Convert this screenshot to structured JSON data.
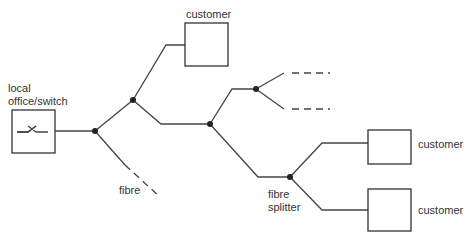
{
  "diagram": {
    "labels": {
      "local_office": "local",
      "local_office_line2": "office/switch",
      "fibre": "fibre",
      "splitter_line1": "fibre",
      "splitter_line2": "splitter",
      "customer_top": "customer",
      "customer_right_upper": "customer",
      "customer_right_lower": "customer"
    },
    "colors": {
      "line": "#444444",
      "node": "#222222",
      "box": "#333333"
    }
  }
}
